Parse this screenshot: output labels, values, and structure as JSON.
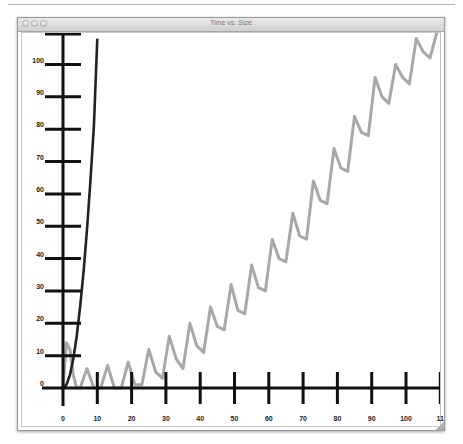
{
  "window": {
    "title": "Time vs. Size",
    "buttons": [
      "close",
      "minimize",
      "zoom"
    ]
  },
  "colors": {
    "axis": "#111111",
    "series_black": "#222222",
    "series_gray": "#a8a8a8",
    "titlebar": "#d8d8d8"
  },
  "chart_data": {
    "type": "line",
    "title": "Time vs. Size",
    "xlabel": "",
    "ylabel": "",
    "xlim": [
      0,
      110
    ],
    "ylim": [
      0,
      108
    ],
    "grid": false,
    "legend": null,
    "x_ticks": [
      0,
      10,
      20,
      30,
      40,
      50,
      60,
      70,
      80,
      90,
      100,
      110
    ],
    "x_tick_labels": [
      "0",
      "10",
      "20",
      "30",
      "40",
      "50",
      "60",
      "70",
      "80",
      "90",
      "100",
      "11"
    ],
    "y_ticks": [
      0,
      10,
      20,
      30,
      40,
      50,
      60,
      70,
      80,
      90,
      100
    ],
    "y_tick_labels": [
      "0",
      "10",
      "20",
      "30",
      "40",
      "50",
      "60",
      "70",
      "80",
      "90",
      "100"
    ],
    "series": [
      {
        "name": "quadratic",
        "color": "#222222",
        "x": [
          0,
          1,
          2,
          3,
          4,
          5,
          6,
          7,
          8,
          9,
          10
        ],
        "y": [
          0,
          1,
          4,
          9,
          16,
          25,
          36,
          49,
          64,
          81,
          108
        ]
      },
      {
        "name": "oscillating",
        "color": "#a8a8a8",
        "x": [
          0,
          1,
          2,
          3,
          4,
          5,
          7,
          9,
          11,
          13,
          15,
          17,
          19,
          21,
          23,
          25,
          27,
          29,
          31,
          33,
          35,
          37,
          39,
          41,
          43,
          45,
          47,
          49,
          51,
          53,
          55,
          57,
          59,
          61,
          63,
          65,
          67,
          69,
          71,
          73,
          75,
          77,
          79,
          81,
          83,
          85,
          87,
          89,
          91,
          93,
          95,
          97,
          99,
          101,
          103,
          105,
          107,
          109
        ],
        "y": [
          0,
          14,
          12,
          4,
          0,
          0,
          6,
          0,
          0,
          7,
          0,
          0,
          8,
          1,
          1,
          12,
          5,
          3,
          16,
          9,
          6,
          20,
          13,
          11,
          25,
          19,
          18,
          32,
          24,
          23,
          38,
          31,
          30,
          46,
          40,
          39,
          54,
          47,
          46,
          64,
          58,
          57,
          74,
          68,
          67,
          84,
          79,
          78,
          96,
          90,
          88,
          100,
          96,
          94,
          108,
          104,
          102,
          110
        ]
      }
    ]
  }
}
